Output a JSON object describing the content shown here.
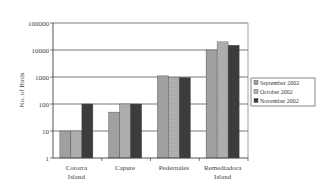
{
  "chart_data": {
    "type": "bar",
    "title": "",
    "xlabel": "",
    "ylabel": "No. of Birds",
    "yscale": "log",
    "ylim": [
      1,
      100000
    ],
    "yticks": [
      "1",
      "10",
      "100",
      "1000",
      "10000",
      "100000"
    ],
    "grid": true,
    "legend_position": "right",
    "categories": [
      "Cotorra Island",
      "Capure",
      "Pedernales",
      "Remediadora Island"
    ],
    "category_lines": [
      [
        "Cotorra",
        "Island"
      ],
      [
        "Capure"
      ],
      [
        "Pedernales"
      ],
      [
        "Remediadora",
        "Island"
      ]
    ],
    "series": [
      {
        "name": "September 2002",
        "color": "#a0a0a0",
        "values": [
          10,
          50,
          1100,
          10000
        ]
      },
      {
        "name": "October 2002",
        "color": "#b4b4b4",
        "values": [
          10,
          100,
          950,
          20000
        ]
      },
      {
        "name": "November 2002",
        "color": "#3c3c3c",
        "values": [
          100,
          100,
          950,
          15000
        ]
      }
    ]
  }
}
